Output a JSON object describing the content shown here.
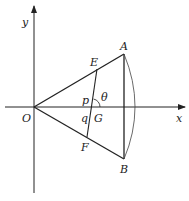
{
  "diagram": {
    "axes": {
      "x_label": "x",
      "y_label": "y"
    },
    "points": {
      "O": {
        "label": "O"
      },
      "A": {
        "label": "A"
      },
      "B": {
        "label": "B"
      },
      "E": {
        "label": "E"
      },
      "F": {
        "label": "F"
      },
      "G": {
        "label": "G"
      }
    },
    "segment_labels": {
      "p": "p",
      "q": "q"
    },
    "angle_label": "θ",
    "colors": {
      "stroke": "#222222",
      "background": "#ffffff"
    }
  }
}
